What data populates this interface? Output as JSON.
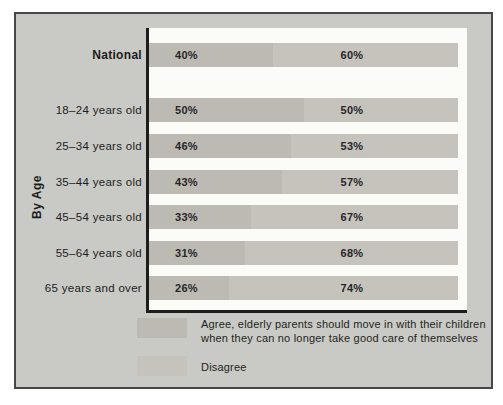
{
  "figure": {
    "group_axis_label": "By Age"
  },
  "colors": {
    "agree": "#bdbab3",
    "disagree": "#c6c3bd",
    "panel": "#c9cac5",
    "plot_bg": "#fbfbf8",
    "frame_border": "#47474a",
    "axis": "#1d1d1b"
  },
  "legend": {
    "agree_label": "Agree, elderly parents should move in with their children when they can no longer take good care of themselves",
    "disagree_label": "Disagree"
  },
  "chart_data": {
    "type": "bar",
    "orientation": "horizontal",
    "stacked": true,
    "unit": "%",
    "xlim": [
      0,
      100
    ],
    "legend_position": "bottom",
    "series_names": [
      "Agree",
      "Disagree"
    ],
    "group_label": "By Age",
    "categories": [
      "National",
      "18–24 years old",
      "25–34 years old",
      "35–44 years old",
      "45–54 years old",
      "55–64 years old",
      "65 years and over"
    ],
    "rows": [
      {
        "label": "National",
        "agree": 40,
        "disagree": 60,
        "agree_text": "40%",
        "disagree_text": "60%"
      },
      {
        "label": "18–24 years old",
        "agree": 50,
        "disagree": 50,
        "agree_text": "50%",
        "disagree_text": "50%"
      },
      {
        "label": "25–34 years old",
        "agree": 46,
        "disagree": 53,
        "agree_text": "46%",
        "disagree_text": "53%"
      },
      {
        "label": "35–44 years old",
        "agree": 43,
        "disagree": 57,
        "agree_text": "43%",
        "disagree_text": "57%"
      },
      {
        "label": "45–54 years old",
        "agree": 33,
        "disagree": 67,
        "agree_text": "33%",
        "disagree_text": "67%"
      },
      {
        "label": "55–64 years old",
        "agree": 31,
        "disagree": 68,
        "agree_text": "31%",
        "disagree_text": "68%"
      },
      {
        "label": "65 years and over",
        "agree": 26,
        "disagree": 74,
        "agree_text": "26%",
        "disagree_text": "74%"
      }
    ]
  }
}
